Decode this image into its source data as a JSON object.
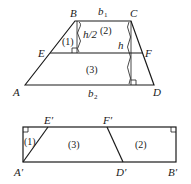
{
  "top_figure": {
    "description": "Trapezoid ABCD with midline EF",
    "vertices": {
      "A": "A",
      "B": "B",
      "C": "C",
      "D": "D",
      "E": "E",
      "F": "F"
    },
    "side_labels": {
      "top": "b",
      "top_sub": "1",
      "bottom": "b",
      "bottom_sub": "2"
    },
    "height_labels": {
      "half": "h/2",
      "full": "h"
    },
    "regions": {
      "r1": "(1)",
      "r2": "(2)",
      "r3": "(3)"
    }
  },
  "bottom_figure": {
    "description": "Rearranged rectangle A'B' with pieces",
    "vertices": {
      "A": "A′",
      "B": "B′",
      "D": "D′",
      "E": "E′",
      "F": "F′"
    },
    "regions": {
      "r1": "(1)",
      "r3": "(3)",
      "r2": "(2)"
    }
  },
  "colors": {
    "stroke": "#1a1a1a",
    "background": "#ffffff"
  }
}
